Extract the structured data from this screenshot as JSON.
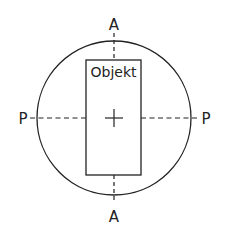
{
  "diagram": {
    "title": "",
    "object_label": "Objekt",
    "axis_labels": {
      "top": "A",
      "bottom": "A",
      "left": "P",
      "right": "P"
    },
    "colors": {
      "stroke": "#222222",
      "background": "#ffffff"
    },
    "elements": [
      {
        "type": "circle",
        "name": "field-of-view",
        "cx": 114,
        "cy": 118,
        "r": 77
      },
      {
        "type": "rect",
        "name": "object",
        "x": 86,
        "y": 60,
        "w": 55,
        "h": 115,
        "label": "Objekt"
      },
      {
        "type": "dashed-line",
        "name": "axis-A",
        "orientation": "vertical",
        "labels": [
          "A",
          "A"
        ]
      },
      {
        "type": "dashed-line",
        "name": "axis-P",
        "orientation": "horizontal",
        "labels": [
          "P",
          "P"
        ]
      },
      {
        "type": "cross",
        "name": "center-mark",
        "x": 114,
        "y": 118
      }
    ]
  }
}
